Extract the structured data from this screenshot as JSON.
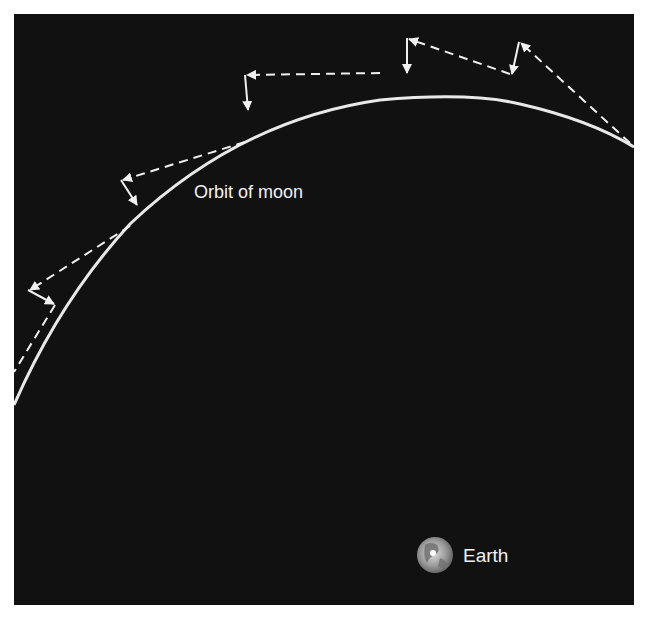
{
  "diagram": {
    "background_color": "#111111",
    "line_color": "#e8e8e8",
    "labels": {
      "orbit": "Orbit of moon",
      "earth": "Earth"
    },
    "orbit": {
      "description": "Curved arc representing the moon's orbit",
      "start": [
        14,
        405
      ],
      "end": [
        634,
        147
      ]
    },
    "arrows": [
      {
        "tangent_from": [
          55,
          305
        ],
        "tangent_to": [
          28,
          290
        ],
        "fall_to": [
          55,
          305
        ],
        "note": "tangential velocity (dashed) and fall toward Earth (solid)"
      },
      {
        "tangent_from": [
          130,
          226
        ],
        "tangent_to": [
          121,
          180
        ],
        "fall_to": [
          138,
          205
        ]
      },
      {
        "tangent_from": [
          245,
          142
        ],
        "tangent_to": [
          245,
          75
        ],
        "fall_to": [
          248,
          110
        ]
      },
      {
        "tangent_from": [
          380,
          73
        ],
        "tangent_to": [
          407,
          38
        ],
        "fall_to": [
          407,
          73
        ]
      },
      {
        "tangent_from": [
          510,
          74
        ],
        "tangent_to": [
          519,
          42
        ],
        "fall_to": [
          512,
          74
        ]
      }
    ],
    "icons": {
      "earth": "earth-globe-icon"
    }
  }
}
